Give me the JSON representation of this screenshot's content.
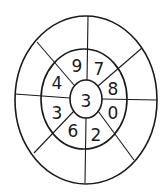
{
  "diagram": {
    "title": "",
    "center": {
      "label": "3"
    },
    "ring_segments": [
      {
        "position": "top-left",
        "label": "9"
      },
      {
        "position": "top-right",
        "label": "7"
      },
      {
        "position": "right-upper",
        "label": "8"
      },
      {
        "position": "right-lower",
        "label": "0"
      },
      {
        "position": "bottom-right",
        "label": "2"
      },
      {
        "position": "bottom-left",
        "label": "6"
      },
      {
        "position": "left-lower",
        "label": "3"
      },
      {
        "position": "left-upper",
        "label": "4"
      }
    ],
    "outer_segments": [
      "",
      "",
      "",
      "",
      "",
      "",
      "",
      ""
    ],
    "stroke_color": "#1a1a1a"
  }
}
